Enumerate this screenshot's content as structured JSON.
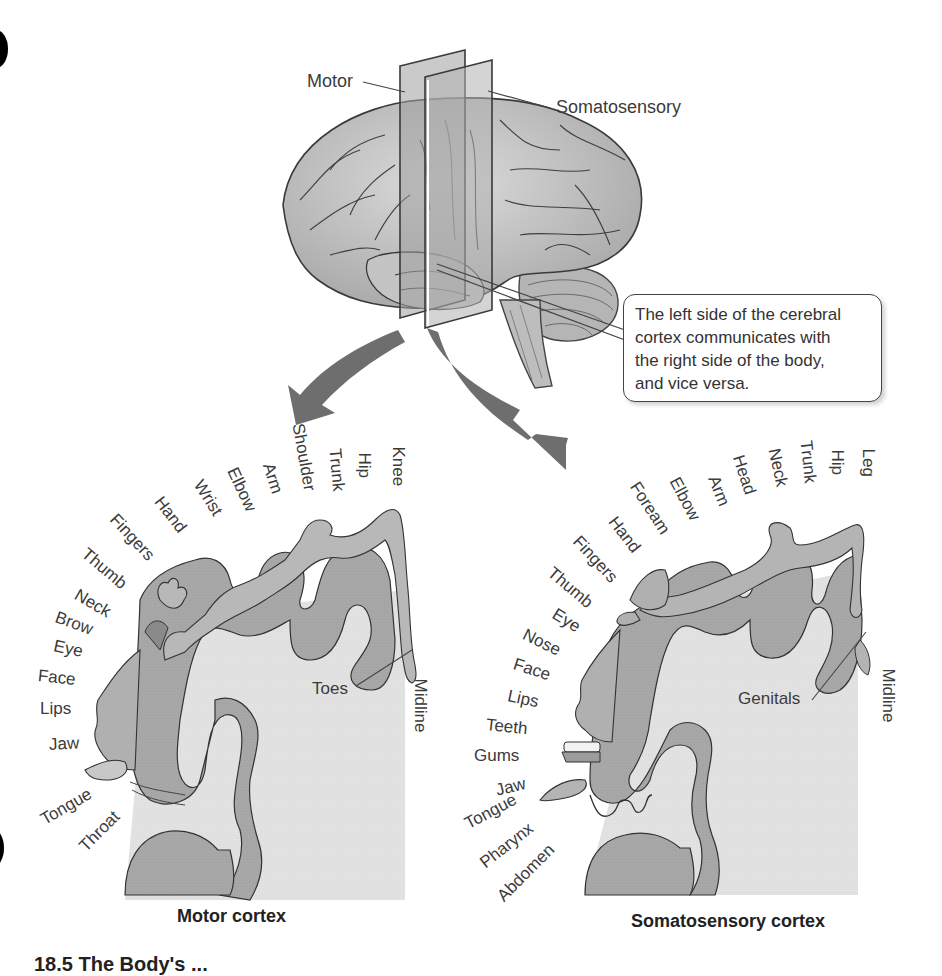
{
  "figure": {
    "brain_labels": {
      "motor": "Motor",
      "somatosensory": "Somatosensory"
    },
    "callout": {
      "lines": [
        "The left side of the cerebral",
        "cortex communicates with",
        "the right side of the body,",
        "and vice versa."
      ]
    },
    "motor_cortex": {
      "title": "Motor cortex",
      "body_parts": [
        "Knee",
        "Hip",
        "Trunk",
        "Shoulder",
        "Arm",
        "Elbow",
        "Wrist",
        "Hand",
        "Fingers",
        "Thumb",
        "Neck",
        "Brow",
        "Eye",
        "Face",
        "Lips",
        "Jaw",
        "Tongue",
        "Throat"
      ],
      "inner_labels": {
        "toes": "Toes",
        "midline": "Midline"
      }
    },
    "somatosensory_cortex": {
      "title": "Somatosensory cortex",
      "body_parts": [
        "Leg",
        "Hip",
        "Trunk",
        "Neck",
        "Head",
        "Arm",
        "Elbow",
        "Foream",
        "Hand",
        "Fingers",
        "Thumb",
        "Eye",
        "Nose",
        "Face",
        "Lips",
        "Teeth",
        "Gums",
        "Jaw",
        "Tongue",
        "Pharynx",
        "Abdomen"
      ],
      "inner_labels": {
        "genitals": "Genitals",
        "midline": "Midline"
      }
    },
    "caption_partial": "18.5 The Body's ...",
    "colors": {
      "cortex_gray": "#a9a9a9",
      "white_matter": "#e4e4e4",
      "arrow_gray": "#6e6e6e",
      "plane_gray": "#9a9a9a"
    }
  }
}
